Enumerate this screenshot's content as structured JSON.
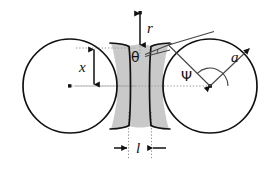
{
  "figure": {
    "name": "sintering-neck-geometry-diagram",
    "background_color": "#ffffff",
    "outline_color": "#111111",
    "neck_fill_color": "#c9c9c9",
    "dotted_guide_color": "#999999",
    "thin_line_color": "#444444"
  },
  "labels": {
    "r": "r",
    "x": "x",
    "l": "l",
    "a": "a",
    "theta": "θ",
    "psi": "Ψ"
  },
  "geometry": {
    "left_circle": {
      "cx": 70,
      "cy": 86,
      "r": 47
    },
    "right_circle": {
      "cx": 210,
      "cy": 86,
      "r": 47
    },
    "neck_half_width": 11,
    "neck_center_x": 140,
    "neck_radius": 33
  },
  "annotations": {
    "r_arrow": {
      "x": 140,
      "y_top": 12,
      "y_bottom": 46,
      "label_side": "right"
    },
    "x_arrow": {
      "x": 94,
      "y_top": 48,
      "y_bottom": 86,
      "label_side": "left"
    },
    "l_arrow": {
      "y": 148,
      "x_left": 128,
      "x_right": 152,
      "label_position": "between"
    },
    "a_radius": {
      "from_x": 210,
      "from_y": 86,
      "to_x": 248,
      "to_y": 50
    },
    "psi_angle": {
      "vertex_x": 210,
      "vertex_y": 86,
      "arc_radius": 18
    },
    "theta_angle": {
      "vertex_x": 146,
      "vertex_y": 52
    }
  }
}
